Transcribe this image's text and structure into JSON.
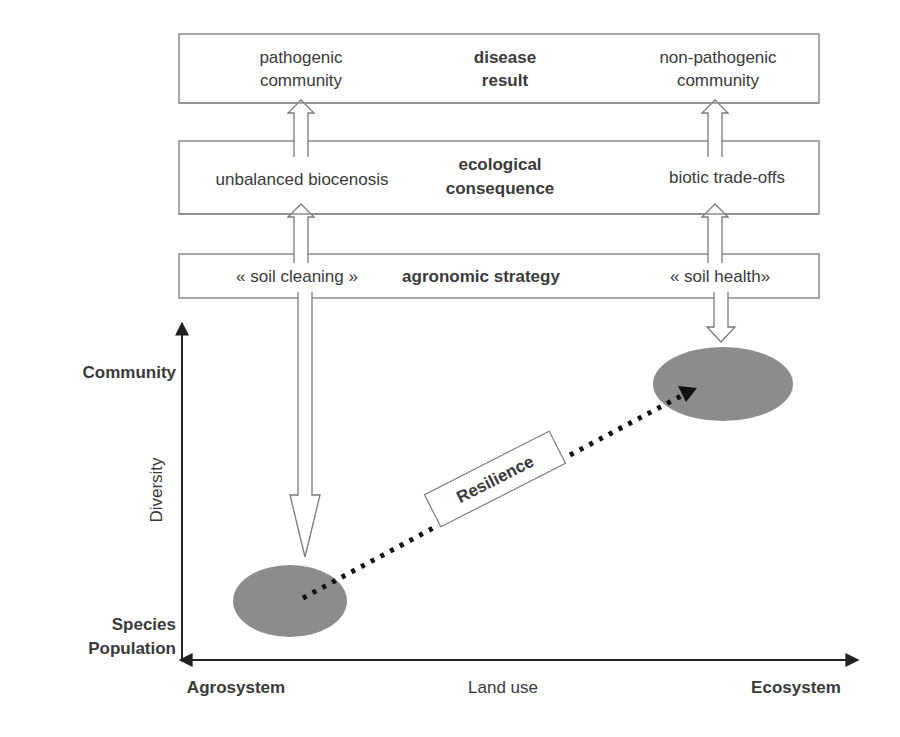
{
  "colors": {
    "ink": "#3a3a3a",
    "box_border": "#8a8a8a",
    "ellipse_fill": "#8c8c8c",
    "arrow_outline": "#7a7a7a",
    "background": "#ffffff"
  },
  "rows": {
    "result": {
      "left": {
        "line1": "pathogenic",
        "line2": "community"
      },
      "center": {
        "line1": "disease",
        "line2": "result"
      },
      "right": {
        "line1": "non-pathogenic",
        "line2": "community"
      }
    },
    "consequence": {
      "left": "unbalanced biocenosis",
      "center": {
        "line1": "ecological",
        "line2": "consequence"
      },
      "right": "biotic trade-offs"
    },
    "strategy": {
      "left": "« soil cleaning »",
      "center": "agronomic strategy",
      "right": "« soil health»"
    }
  },
  "axes": {
    "y_top_label": "Community",
    "y_title": "Diversity",
    "y_bottom_label_1": "Species",
    "y_bottom_label_2": "Population",
    "x_left_label": "Agrosystem",
    "x_title": "Land use",
    "x_right_label": "Ecosystem"
  },
  "trajectory": {
    "label": "Resilience",
    "style": "dotted-arrow",
    "from": "agrosystem-species-population",
    "to": "ecosystem-community"
  },
  "icons": {
    "up_arrow": "hollow-up-arrow",
    "down_arrow": "hollow-down-arrow",
    "axis_arrow": "solid-arrowhead"
  }
}
